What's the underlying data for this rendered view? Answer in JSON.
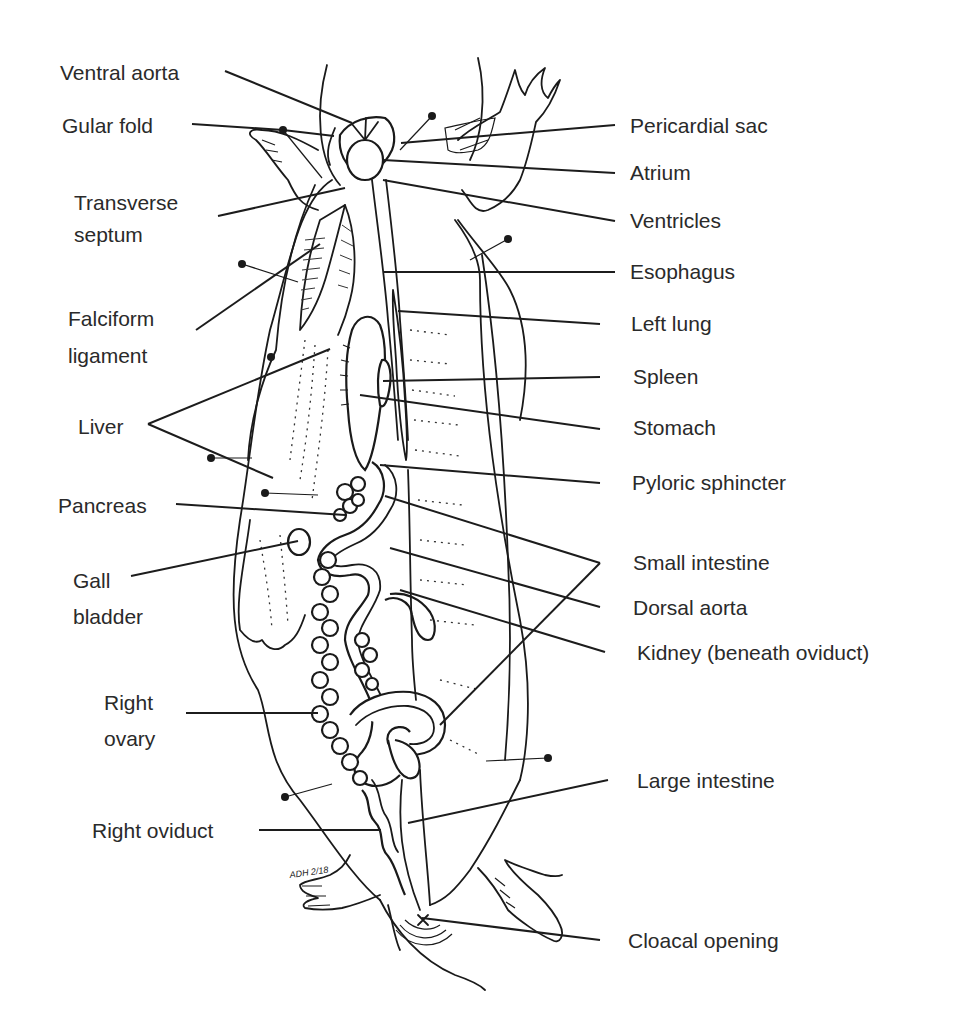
{
  "figure": {
    "artist_signature": "ADH 2/18",
    "colors": {
      "ink": "#1a1a1a",
      "label_text": "#2a2a2a",
      "background": "#ffffff"
    }
  },
  "labels_left": [
    {
      "id": "ventral-aorta",
      "lines": [
        "Ventral aorta"
      ],
      "x": 60,
      "y": 60
    },
    {
      "id": "gular-fold",
      "lines": [
        "Gular fold"
      ],
      "x": 62,
      "y": 113
    },
    {
      "id": "transverse-septum",
      "lines": [
        "Transverse",
        "septum"
      ],
      "x": 74,
      "y": 187
    },
    {
      "id": "falciform-ligament",
      "lines": [
        "Falciform",
        "ligament"
      ],
      "x": 68,
      "y": 300
    },
    {
      "id": "liver",
      "lines": [
        "Liver"
      ],
      "x": 78,
      "y": 414
    },
    {
      "id": "pancreas",
      "lines": [
        "Pancreas"
      ],
      "x": 58,
      "y": 493
    },
    {
      "id": "gall-bladder",
      "lines": [
        "Gall",
        "bladder"
      ],
      "x": 73,
      "y": 563
    },
    {
      "id": "right-ovary",
      "lines": [
        "Right",
        "ovary"
      ],
      "x": 104,
      "y": 685
    },
    {
      "id": "right-oviduct",
      "lines": [
        "Right oviduct"
      ],
      "x": 92,
      "y": 818
    }
  ],
  "labels_right": [
    {
      "id": "pericardial-sac",
      "lines": [
        "Pericardial sac"
      ],
      "x": 630,
      "y": 113
    },
    {
      "id": "atrium",
      "lines": [
        "Atrium"
      ],
      "x": 630,
      "y": 160
    },
    {
      "id": "ventricles",
      "lines": [
        "Ventricles"
      ],
      "x": 630,
      "y": 208
    },
    {
      "id": "esophagus",
      "lines": [
        "Esophagus"
      ],
      "x": 630,
      "y": 259
    },
    {
      "id": "left-lung",
      "lines": [
        "Left lung"
      ],
      "x": 631,
      "y": 311
    },
    {
      "id": "spleen",
      "lines": [
        "Spleen"
      ],
      "x": 633,
      "y": 364
    },
    {
      "id": "stomach",
      "lines": [
        "Stomach"
      ],
      "x": 633,
      "y": 415
    },
    {
      "id": "pyloric-sphincter",
      "lines": [
        "Pyloric sphincter"
      ],
      "x": 632,
      "y": 470
    },
    {
      "id": "small-intestine",
      "lines": [
        "Small intestine"
      ],
      "x": 633,
      "y": 550
    },
    {
      "id": "dorsal-aorta",
      "lines": [
        "Dorsal aorta"
      ],
      "x": 633,
      "y": 595
    },
    {
      "id": "kidney",
      "lines": [
        "Kidney (beneath oviduct)"
      ],
      "x": 637,
      "y": 640
    },
    {
      "id": "large-intestine",
      "lines": [
        "Large intestine"
      ],
      "x": 637,
      "y": 768
    },
    {
      "id": "cloacal-opening",
      "lines": [
        "Cloacal opening"
      ],
      "x": 628,
      "y": 928
    }
  ],
  "leader_lines": [
    {
      "label": "ventral-aorta",
      "points": [
        [
          225,
          71
        ],
        [
          352,
          123
        ]
      ]
    },
    {
      "label": "gular-fold",
      "points": [
        [
          192,
          124
        ],
        [
          283,
          130
        ],
        [
          334,
          136
        ]
      ]
    },
    {
      "label": "transverse-septum",
      "points": [
        [
          218,
          216
        ],
        [
          345,
          188
        ]
      ]
    },
    {
      "label": "falciform-ligament",
      "points": [
        [
          196,
          330
        ],
        [
          320,
          244
        ]
      ]
    },
    {
      "label": "liver",
      "points": [
        [
          148,
          424
        ],
        [
          330,
          349
        ]
      ]
    },
    {
      "label": "liver",
      "points": [
        [
          148,
          424
        ],
        [
          273,
          478
        ]
      ]
    },
    {
      "label": "pancreas",
      "points": [
        [
          176,
          504
        ],
        [
          345,
          515
        ]
      ]
    },
    {
      "label": "gall-bladder",
      "points": [
        [
          131,
          576
        ],
        [
          298,
          541
        ]
      ]
    },
    {
      "label": "right-ovary",
      "points": [
        [
          186,
          713
        ],
        [
          318,
          713
        ]
      ]
    },
    {
      "label": "right-oviduct",
      "points": [
        [
          259,
          830
        ],
        [
          381,
          830
        ]
      ]
    },
    {
      "label": "pericardial-sac",
      "points": [
        [
          615,
          125
        ],
        [
          401,
          143
        ]
      ]
    },
    {
      "label": "atrium",
      "points": [
        [
          615,
          173
        ],
        [
          383,
          160
        ]
      ]
    },
    {
      "label": "ventricles",
      "points": [
        [
          615,
          221
        ],
        [
          383,
          180
        ]
      ]
    },
    {
      "label": "esophagus",
      "points": [
        [
          615,
          272
        ],
        [
          383,
          272
        ]
      ]
    },
    {
      "label": "left-lung",
      "points": [
        [
          600,
          324
        ],
        [
          398,
          311
        ]
      ]
    },
    {
      "label": "spleen",
      "points": [
        [
          600,
          377
        ],
        [
          383,
          381
        ]
      ]
    },
    {
      "label": "stomach",
      "points": [
        [
          600,
          429
        ],
        [
          360,
          395
        ]
      ]
    },
    {
      "label": "pyloric-sphincter",
      "points": [
        [
          600,
          483
        ],
        [
          380,
          465
        ]
      ]
    },
    {
      "label": "small-intestine",
      "points": [
        [
          600,
          563
        ],
        [
          385,
          496
        ]
      ]
    },
    {
      "label": "small-intestine",
      "points": [
        [
          600,
          563
        ],
        [
          440,
          725
        ]
      ]
    },
    {
      "label": "dorsal-aorta",
      "points": [
        [
          600,
          607
        ],
        [
          390,
          548
        ]
      ]
    },
    {
      "label": "kidney",
      "points": [
        [
          605,
          652
        ],
        [
          400,
          590
        ]
      ]
    },
    {
      "label": "large-intestine",
      "points": [
        [
          608,
          780
        ],
        [
          408,
          823
        ]
      ]
    },
    {
      "label": "cloacal-opening",
      "points": [
        [
          600,
          940
        ],
        [
          422,
          918
        ]
      ]
    }
  ],
  "pins": [
    [
      283,
      130
    ],
    [
      432,
      116
    ],
    [
      508,
      239
    ],
    [
      242,
      264
    ],
    [
      271,
      357
    ],
    [
      211,
      458
    ],
    [
      265,
      493
    ],
    [
      285,
      797
    ],
    [
      548,
      758
    ]
  ]
}
